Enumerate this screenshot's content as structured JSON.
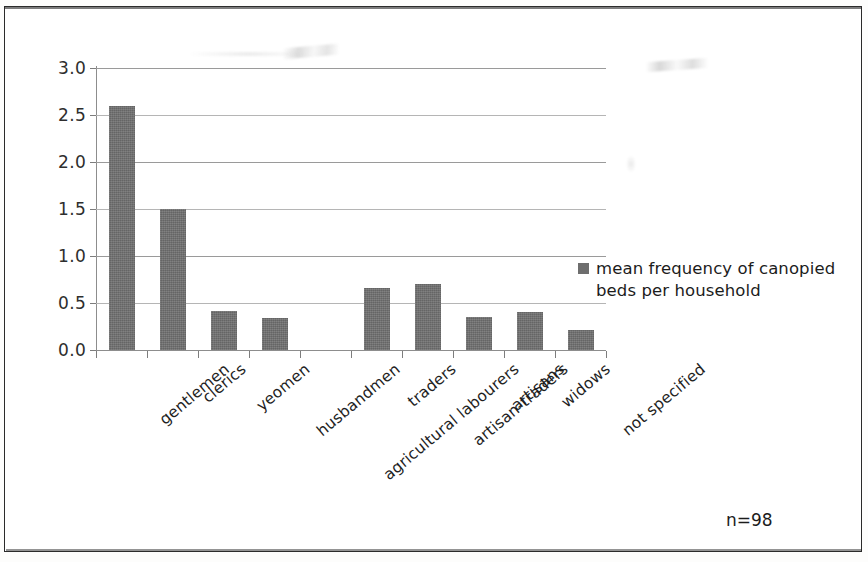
{
  "chart_data": {
    "type": "bar",
    "title": "",
    "subtitle": "",
    "xlabel": "",
    "ylabel": "",
    "ylim": [
      0,
      3.0
    ],
    "ytick_labels": [
      "0.0",
      "0.5",
      "1.0",
      "1.5",
      "2.0",
      "2.5",
      "3.0"
    ],
    "ytick_values": [
      0.0,
      0.5,
      1.0,
      1.5,
      2.0,
      2.5,
      3.0
    ],
    "grid": true,
    "legend_position": "right",
    "categories": [
      "gentlemen",
      "clerics",
      "yeomen",
      "husbandmen",
      "agricultural labourers",
      "traders",
      "artisan-traders",
      "artisans",
      "widows",
      "not specified"
    ],
    "series": [
      {
        "name": "mean frequency of canopied beds per household",
        "values": [
          2.6,
          1.5,
          0.41,
          0.34,
          0.0,
          0.66,
          0.7,
          0.35,
          0.4,
          0.21
        ],
        "color": "#6e6e6e"
      }
    ],
    "annotations": [
      {
        "text": "n=98"
      }
    ]
  },
  "legend": {
    "entries": [
      {
        "label_line1": "mean frequency of canopied",
        "label_line2": "beds per household",
        "swatch_color": "#6e6e6e"
      }
    ]
  },
  "annotation": {
    "sample_size": "n=98"
  },
  "colors": {
    "bar": "#6e6e6e",
    "gridline": "#9a9a9a",
    "axis": "#8d8d8d",
    "text": "#1f1f1f",
    "frame": "#2b2b2b",
    "background": "#ffffff"
  }
}
